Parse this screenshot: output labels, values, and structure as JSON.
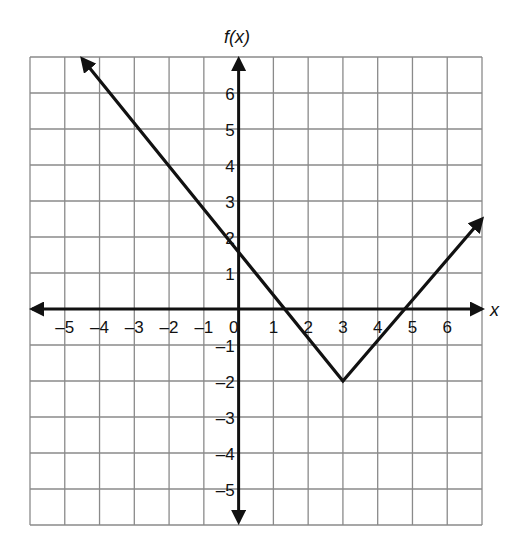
{
  "chart_data": {
    "type": "line",
    "title": "",
    "xlabel": "x",
    "ylabel": "f(x)",
    "xlim": [
      -6,
      7
    ],
    "ylim": [
      -6,
      7
    ],
    "grid": true,
    "x_ticks": [
      "-5",
      "-4",
      "-3",
      "-2",
      "-1",
      "0",
      "1",
      "2",
      "3",
      "4",
      "5",
      "6"
    ],
    "y_ticks": [
      "6",
      "5",
      "4",
      "3",
      "2",
      "1",
      "-1",
      "-2",
      "-3",
      "-4",
      "-5"
    ],
    "series": [
      {
        "name": "f(x)",
        "shape": "absolute-value V",
        "points": [
          [
            -4.5,
            6.95
          ],
          [
            3,
            -2
          ],
          [
            7,
            2.5
          ]
        ],
        "vertex": [
          3,
          -2
        ],
        "y_intercept": 1.6,
        "x_intercepts": [
          1.35,
          4.75
        ]
      }
    ],
    "colors": {
      "line": "#111111",
      "grid": "#8a8a8a",
      "axis": "#111111"
    }
  }
}
